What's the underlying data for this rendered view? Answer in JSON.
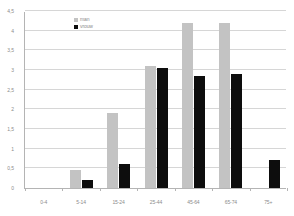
{
  "chart_data": {
    "type": "bar",
    "title": "",
    "subtitle": "",
    "xlabel": "",
    "ylabel": "",
    "categories": [
      "0-4",
      "5-14",
      "15-24",
      "25-44",
      "45-64",
      "65-74",
      "75+"
    ],
    "series": [
      {
        "name": "man",
        "color": "#c3c3c3",
        "values": [
          0,
          0.45,
          1.9,
          3.1,
          4.2,
          4.2,
          0
        ]
      },
      {
        "name": "vrouw",
        "color": "#0d0d0d",
        "values": [
          0,
          0.2,
          0.6,
          3.05,
          2.85,
          2.9,
          0.7
        ]
      }
    ],
    "ylim": [
      0,
      4.5
    ],
    "ytick_values": [
      0,
      0.5,
      1,
      1.5,
      2,
      2.5,
      3,
      3.5,
      4,
      4.5
    ],
    "ytick_labels": [
      "0",
      "0,5",
      "1",
      "1,5",
      "2",
      "2,5",
      "3",
      "3,5",
      "4",
      "4,5"
    ],
    "grid": true,
    "grid_axis": "y",
    "legend": [
      "man",
      "vrouw"
    ],
    "legend_position": "top-left-inside",
    "annotations": []
  },
  "axes": {
    "axis_color": "#b4b4b4",
    "grid_color": "#d6d6d6",
    "tick_text_color": "#8c8c8c"
  }
}
